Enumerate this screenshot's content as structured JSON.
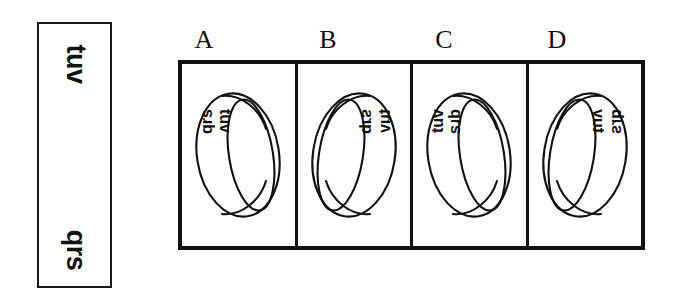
{
  "figure": {
    "background_color": "#ffffff",
    "ink_color": "#111111",
    "type": "mental-rotation-ring-task"
  },
  "reference_strip": {
    "name": "unrolled-band-strip",
    "top_label": "tuv",
    "bottom_label": "qrs",
    "rotation_deg": 90,
    "border_color": "#1a1a1a"
  },
  "panels": [
    {
      "letter": "A",
      "mirrored": false,
      "ring_label_top": "tuv",
      "ring_label_bottom": "qrs",
      "ring_label_top_inverted": false,
      "ring_label_bottom_inverted": true,
      "text_side": "left"
    },
    {
      "letter": "B",
      "mirrored": true,
      "ring_label_top": "qrs",
      "ring_label_bottom": "tuv",
      "ring_label_top_inverted": true,
      "ring_label_bottom_inverted": false,
      "text_side": "right"
    },
    {
      "letter": "C",
      "mirrored": false,
      "ring_label_top": "qrs",
      "ring_label_bottom": "tuv",
      "ring_label_top_inverted": false,
      "ring_label_bottom_inverted": true,
      "text_side": "left"
    },
    {
      "letter": "D",
      "mirrored": true,
      "ring_label_top": "tuv",
      "ring_label_bottom": "qrs",
      "ring_label_top_inverted": true,
      "ring_label_bottom_inverted": false,
      "text_side": "right"
    }
  ]
}
